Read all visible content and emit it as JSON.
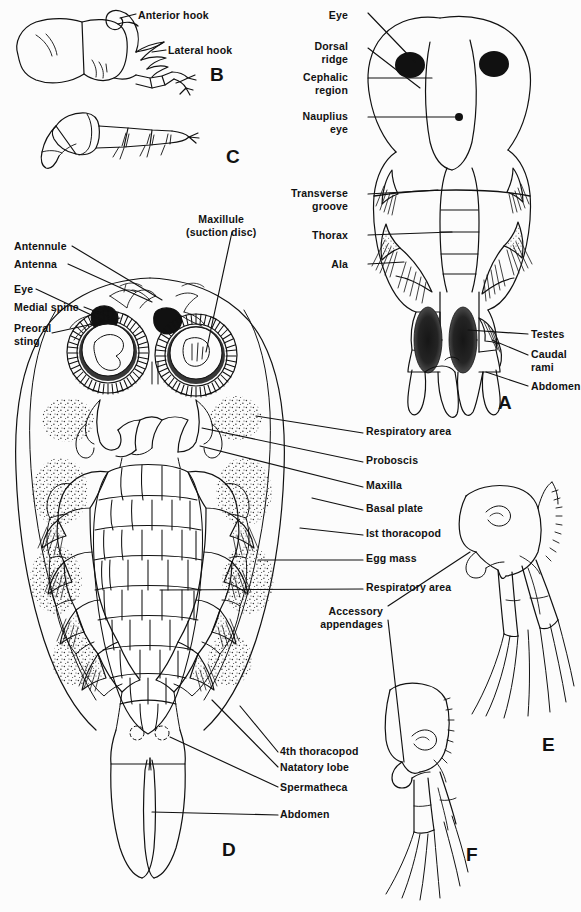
{
  "figure": {
    "background_color": "#fcfcfc",
    "ink_color": "#111111",
    "width": 581,
    "height": 912
  },
  "panel_letters": [
    {
      "letter": "B",
      "x": 210,
      "y": 68
    },
    {
      "letter": "C",
      "x": 226,
      "y": 150
    },
    {
      "letter": "A",
      "x": 498,
      "y": 396
    },
    {
      "letter": "D",
      "x": 222,
      "y": 843
    },
    {
      "letter": "E",
      "x": 542,
      "y": 738
    },
    {
      "letter": "F",
      "x": 466,
      "y": 848
    }
  ],
  "labels": {
    "panel_b": [
      {
        "id": "anterior-hook",
        "text": "Anterior hook",
        "x": 138,
        "y": 10,
        "align": "left"
      },
      {
        "id": "lateral-hook",
        "text": "Lateral hook",
        "x": 170,
        "y": 45,
        "align": "left"
      }
    ],
    "panel_a": [
      {
        "id": "eye",
        "text": "Eye",
        "x": 348,
        "y": 9,
        "align": "right"
      },
      {
        "id": "dorsal-ridge",
        "text": "Dorsal\nridge",
        "x": 348,
        "y": 40,
        "align": "right"
      },
      {
        "id": "cephalic-region",
        "text": "Cephalic\nregion",
        "x": 348,
        "y": 71,
        "align": "right"
      },
      {
        "id": "nauplius-eye",
        "text": "Nauplius\neye",
        "x": 348,
        "y": 110,
        "align": "right"
      },
      {
        "id": "transverse-groove",
        "text": "Transverse\ngroove",
        "x": 348,
        "y": 187,
        "align": "right"
      },
      {
        "id": "thorax",
        "text": "Thorax",
        "x": 348,
        "y": 232,
        "align": "right"
      },
      {
        "id": "ala",
        "text": "Ala",
        "x": 348,
        "y": 261,
        "align": "right"
      },
      {
        "id": "testes",
        "text": "Testes",
        "x": 530,
        "y": 331,
        "align": "left"
      },
      {
        "id": "caudal-rami",
        "text": "Caudal\nrami",
        "x": 530,
        "y": 349,
        "align": "left"
      },
      {
        "id": "abdomen-a",
        "text": "Abdomen",
        "x": 530,
        "y": 382,
        "align": "left"
      }
    ],
    "panel_d_left": [
      {
        "id": "antennule",
        "text": "Antennule",
        "x": 14,
        "y": 242,
        "align": "left"
      },
      {
        "id": "antenna",
        "text": "Antenna",
        "x": 14,
        "y": 261,
        "align": "left"
      },
      {
        "id": "eye-d",
        "text": "Eye",
        "x": 14,
        "y": 285,
        "align": "left"
      },
      {
        "id": "medial-spine",
        "text": "Medial spine",
        "x": 14,
        "y": 303,
        "align": "left"
      },
      {
        "id": "preoral-sting",
        "text": "Preoral\nsting",
        "x": 14,
        "y": 325,
        "align": "left"
      }
    ],
    "panel_d_top": [
      {
        "id": "maxillule-suction-disc",
        "text": "Maxillule\n(suction disc)",
        "x": 195,
        "y": 215,
        "align": "left"
      }
    ],
    "panel_d_right": [
      {
        "id": "respiratory-area-1",
        "text": "Respiratory area",
        "x": 365,
        "y": 429,
        "align": "left"
      },
      {
        "id": "proboscis",
        "text": "Proboscis",
        "x": 365,
        "y": 458,
        "align": "left"
      },
      {
        "id": "maxilla",
        "text": "Maxilla",
        "x": 365,
        "y": 483,
        "align": "left"
      },
      {
        "id": "basal-plate",
        "text": "Basal plate",
        "x": 365,
        "y": 506,
        "align": "left"
      },
      {
        "id": "first-thoracopod",
        "text": "Ist thoracopod",
        "x": 365,
        "y": 531,
        "align": "left"
      },
      {
        "id": "egg-mass",
        "text": "Egg mass",
        "x": 365,
        "y": 556,
        "align": "left"
      },
      {
        "id": "respiratory-area-2",
        "text": "Respiratory area",
        "x": 365,
        "y": 585,
        "align": "left"
      }
    ],
    "panel_d_bottom": [
      {
        "id": "fourth-thoracopod",
        "text": "4th thoracopod",
        "x": 280,
        "y": 749,
        "align": "left"
      },
      {
        "id": "natatory-lobe",
        "text": "Natatory lobe",
        "x": 280,
        "y": 764,
        "align": "left"
      },
      {
        "id": "spermatheca",
        "text": "Spermatheca",
        "x": 280,
        "y": 784,
        "align": "left"
      },
      {
        "id": "abdomen-d",
        "text": "Abdomen",
        "x": 280,
        "y": 812,
        "align": "left"
      }
    ],
    "panel_ef": [
      {
        "id": "accessory-appendages",
        "text": "Accessory\nappendages",
        "x": 383,
        "y": 608,
        "align": "right"
      }
    ]
  }
}
